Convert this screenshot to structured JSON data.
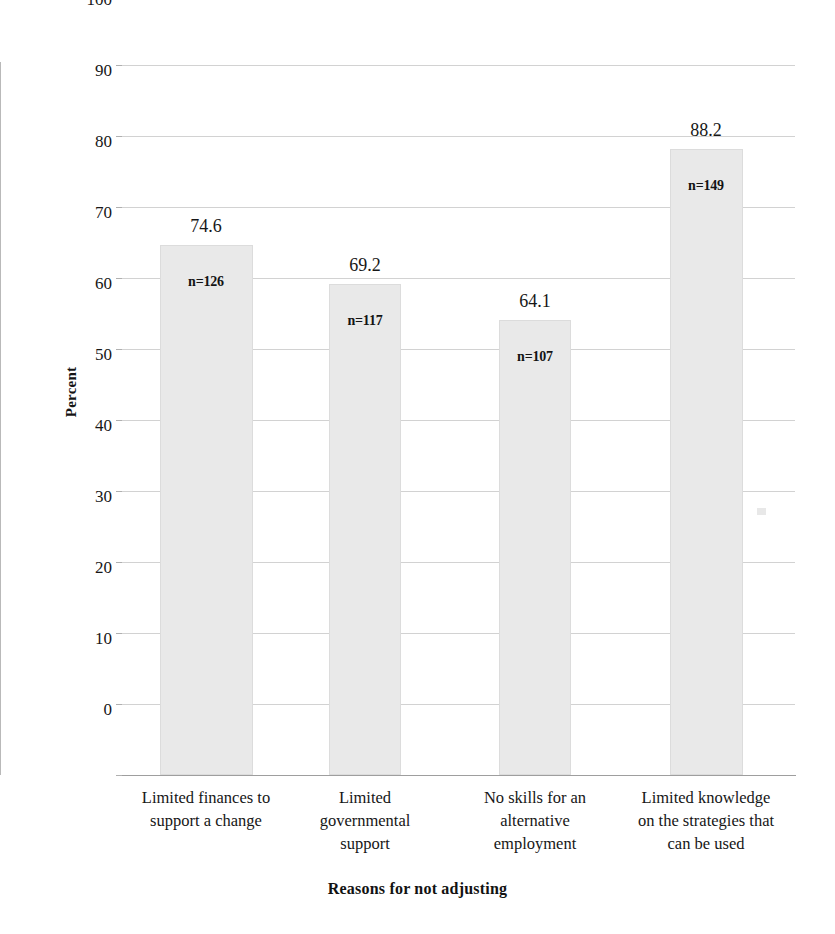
{
  "chart_data": {
    "type": "bar",
    "title": "",
    "xlabel": "Reasons for not adjusting",
    "ylabel": "Percent",
    "ylim": [
      0,
      100
    ],
    "ytick_step": 10,
    "yticks": [
      100,
      90,
      80,
      70,
      60,
      50,
      40,
      30,
      20,
      10,
      0
    ],
    "grid": true,
    "legend": "none",
    "categories": [
      "Limited finances to support a change",
      "Limited governmental support",
      "No skills for an alternative employment",
      "Limited knowledge on the strategies that can be used"
    ],
    "category_lines": [
      [
        "Limited finances to",
        "support a change"
      ],
      [
        "Limited",
        "governmental",
        "support"
      ],
      [
        "No skills for an",
        "alternative",
        "employment"
      ],
      [
        "Limited knowledge",
        "on the strategies that",
        "can be used"
      ]
    ],
    "values": [
      74.6,
      69.2,
      64.1,
      88.2
    ],
    "value_labels": [
      "74.6",
      "69.2",
      "64.1",
      "88.2"
    ],
    "counts": [
      126,
      117,
      107,
      149
    ],
    "count_labels": [
      "n=126",
      "n=117",
      "n=107",
      "n=149"
    ],
    "bar_fill_color": "#e9e9e9",
    "bar_border_color": "#dcdcdc",
    "gridline_color": "#d2d2d2",
    "axis_color": "#a8a8a8",
    "text_color": "#171717"
  }
}
